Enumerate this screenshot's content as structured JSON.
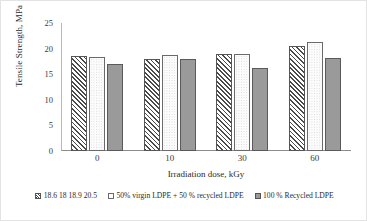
{
  "chart_data": {
    "type": "bar",
    "title": "",
    "subtitle": "",
    "xlabel": "Irradiation dose, kGy",
    "ylabel": "Tensile Strength, MPa",
    "categories": [
      "0",
      "10",
      "30",
      "60"
    ],
    "ylim": [
      0,
      25
    ],
    "yticks": [
      "0",
      "5",
      "10",
      "15",
      "20",
      "25"
    ],
    "grid": false,
    "legend_position": "bottom",
    "series": [
      {
        "name": "18.6 18 18.9 20.5",
        "pattern": "diagonal-hatch",
        "color": "#4a4a4a",
        "values": [
          18.6,
          18.0,
          18.9,
          20.5
        ]
      },
      {
        "name": "50% virgin LDPE + 50 % recycled LDPE",
        "pattern": "dotted-white",
        "color": "#fcfcfc",
        "values": [
          18.4,
          18.7,
          18.9,
          21.3
        ]
      },
      {
        "name": "100 % Recycled LDPE",
        "pattern": "solid-gray",
        "color": "#9a9a9a",
        "values": [
          17.0,
          18.0,
          16.3,
          18.1
        ]
      }
    ]
  }
}
